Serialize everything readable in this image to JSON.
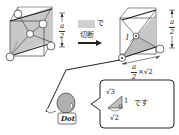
{
  "colors": {
    "face_gray": "#c8c8c8",
    "line": "#222222",
    "arrow_box": "#d0d0d0",
    "character_body": "#b0b0b0"
  },
  "left_cube": {
    "dimension_label": {
      "numerator": "a",
      "denominator": "2"
    }
  },
  "operation": {
    "blank_box_suffix": "で",
    "action": "切断",
    "arrow": "right-arrow"
  },
  "right_cube": {
    "dimension_label": {
      "numerator": "a",
      "denominator": "2"
    },
    "diagonal_label": "l",
    "base_label": {
      "numerator": "a",
      "denominator": "2",
      "multiplier": "×√2"
    }
  },
  "speech_bubble": {
    "triangle_hypotenuse": "√3",
    "triangle_leg": "1",
    "triangle_base": "√2",
    "suffix": "です"
  },
  "character": {
    "name": "Dot"
  }
}
